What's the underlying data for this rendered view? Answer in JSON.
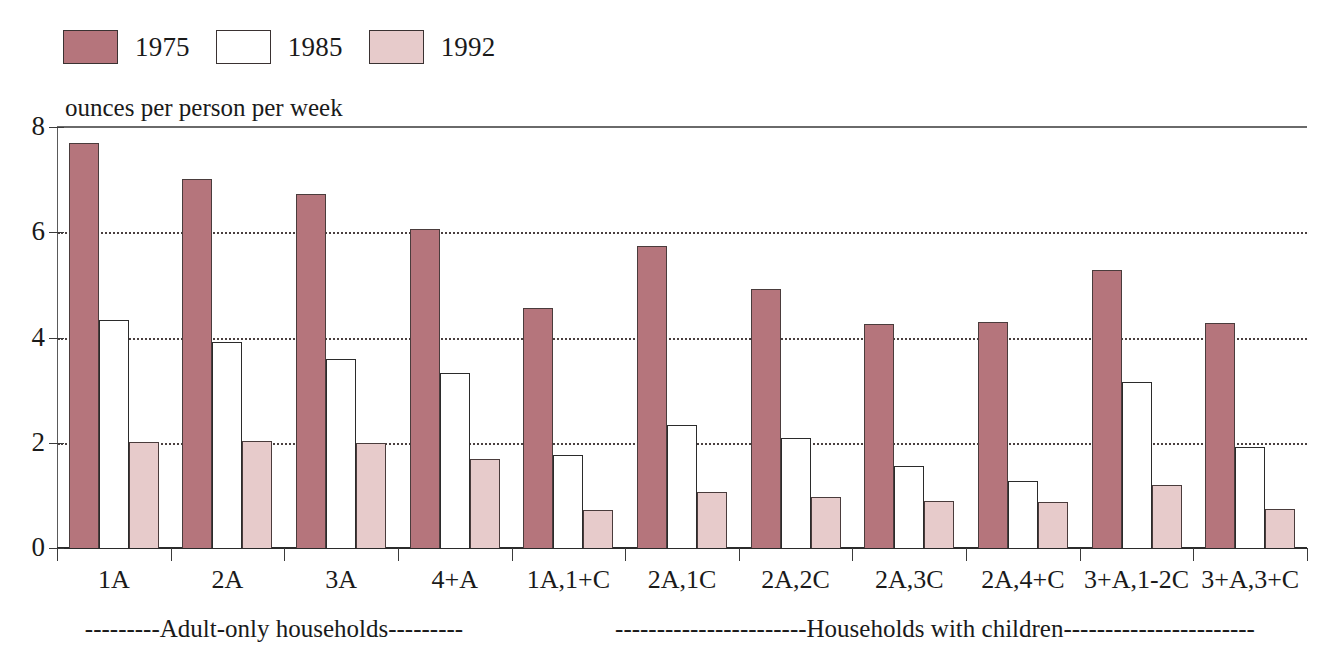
{
  "legend": {
    "items": [
      {
        "label": "1975",
        "color": "#b5757c",
        "swatch": "filled-rose"
      },
      {
        "label": "1985",
        "color": "#ffffff",
        "swatch": "outline-white"
      },
      {
        "label": "1992",
        "color": "#e7cbcb",
        "swatch": "filled-pink"
      }
    ]
  },
  "axis": {
    "y_title": "ounces per person per week",
    "y_ticks": [
      "0",
      "2",
      "4",
      "6",
      "8"
    ]
  },
  "annotations": {
    "adult_only": "---------Adult-only households---------",
    "with_children": "-----------------------Households with children-----------------------"
  },
  "chart_data": {
    "type": "bar",
    "title": "",
    "subtitle": "",
    "xlabel": "",
    "ylabel": "ounces per person per week",
    "ylim": [
      0,
      8
    ],
    "yticks": [
      0,
      2,
      4,
      6,
      8
    ],
    "grid": "horizontal-dotted",
    "legend_position": "top-left",
    "categories": [
      "1A",
      "2A",
      "3A",
      "4+A",
      "1A,1+C",
      "2A,1C",
      "2A,2C",
      "2A,3C",
      "2A,4+C",
      "3+A,1-2C",
      "3+A,3+C"
    ],
    "series": [
      {
        "name": "1975",
        "color": "#b5757c",
        "values": [
          7.7,
          7.02,
          6.72,
          6.07,
          4.57,
          5.73,
          4.92,
          4.25,
          4.3,
          5.28,
          4.27
        ]
      },
      {
        "name": "1985",
        "color": "#ffffff",
        "values": [
          4.33,
          3.92,
          3.6,
          3.33,
          1.77,
          2.33,
          2.1,
          1.55,
          1.27,
          3.15,
          1.92
        ]
      },
      {
        "name": "1992",
        "color": "#e7cbcb",
        "values": [
          2.02,
          2.03,
          2.0,
          1.7,
          0.73,
          1.07,
          0.97,
          0.9,
          0.88,
          1.2,
          0.75
        ]
      }
    ],
    "group_annotations": [
      {
        "label": "Adult-only households",
        "categories": [
          "1A",
          "2A",
          "3A",
          "4+A"
        ]
      },
      {
        "label": "Households with children",
        "categories": [
          "1A,1+C",
          "2A,1C",
          "2A,2C",
          "2A,3C",
          "2A,4+C",
          "3+A,1-2C",
          "3+A,3+C"
        ]
      }
    ]
  }
}
